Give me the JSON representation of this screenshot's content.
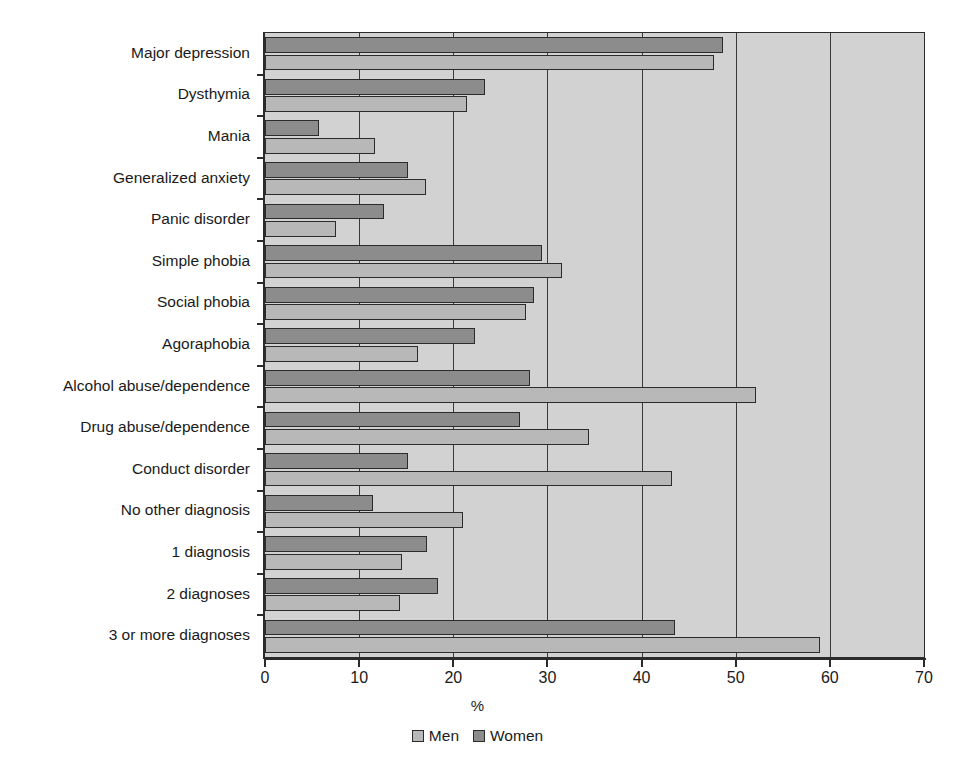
{
  "chart_data": {
    "type": "bar",
    "orientation": "horizontal",
    "title": "",
    "xlabel": "%",
    "ylabel": "",
    "xlim": [
      0,
      70
    ],
    "xticks": [
      0,
      10,
      20,
      30,
      40,
      50,
      60,
      70
    ],
    "xtick_labels": [
      "0",
      "10",
      "20",
      "30",
      "40",
      "50",
      "60",
      "70"
    ],
    "grid": "vertical",
    "legend_position": "bottom-center",
    "categories": [
      "Major depression",
      "Dysthymia",
      "Mania",
      "Generalized anxiety",
      "Panic disorder",
      "Simple phobia",
      "Social phobia",
      "Agoraphobia",
      "Alcohol abuse/dependence",
      "Drug abuse/dependence",
      "Conduct disorder",
      "No other diagnosis",
      "1 diagnosis",
      "2 diagnoses",
      "3 or more diagnoses"
    ],
    "series": [
      {
        "name": "Women",
        "color": "#8c8c8c",
        "values": [
          48.6,
          23.4,
          5.7,
          15.2,
          12.6,
          29.4,
          28.6,
          22.3,
          28.1,
          27.1,
          15.2,
          11.5,
          17.2,
          18.4,
          43.6
        ]
      },
      {
        "name": "Men",
        "color": "#b8b8b8",
        "values": [
          47.7,
          21.5,
          11.7,
          17.1,
          7.5,
          31.5,
          27.7,
          16.2,
          52.2,
          34.4,
          43.2,
          21.0,
          14.6,
          14.3,
          59.0
        ]
      }
    ]
  },
  "legend": {
    "items": [
      {
        "label": "Men",
        "swatch": "men-swatch"
      },
      {
        "label": "Women",
        "swatch": "women-swatch"
      }
    ]
  },
  "axis": {
    "x_title": "%"
  },
  "colors": {
    "plot_background": "#d2d2d2",
    "men": "#b8b8b8",
    "women": "#8c8c8c",
    "axis": "#2b2b2b",
    "grid": "#3a3a3a"
  }
}
